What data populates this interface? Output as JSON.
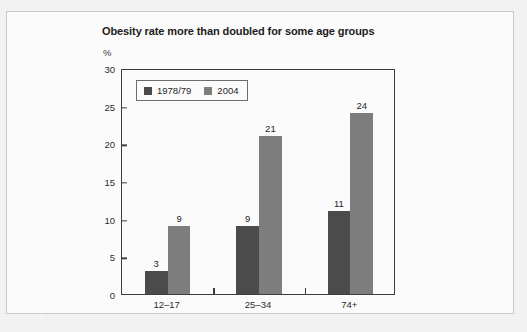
{
  "figure": {
    "title": "Obesity rate more than doubled for some age groups",
    "y_unit_label": "%"
  },
  "legend": {
    "entries": [
      {
        "label": "1978/79",
        "color": "#4b4b4b",
        "swatch_name": "legend-swatch-1978-79"
      },
      {
        "label": "2004",
        "color": "#7d7d7d",
        "swatch_name": "legend-swatch-2004"
      }
    ]
  },
  "chart_data": {
    "type": "bar",
    "title": "Obesity rate more than doubled for some age groups",
    "xlabel": "",
    "ylabel": "%",
    "ylim": [
      0,
      30
    ],
    "yticks": [
      0,
      5,
      10,
      15,
      20,
      25,
      30
    ],
    "ytick_labels": [
      "0",
      "5",
      "10",
      "15",
      "20",
      "25",
      "30"
    ],
    "grid": false,
    "legend_position": "top-left inside plot",
    "categories": [
      "12–17",
      "25–34",
      "74+"
    ],
    "series": [
      {
        "name": "1978/79",
        "color": "#4b4b4b",
        "values": [
          3,
          9,
          11
        ]
      },
      {
        "name": "2004",
        "color": "#7d7d7d",
        "values": [
          9,
          21,
          24
        ]
      }
    ],
    "data_labels": [
      [
        "3",
        "9"
      ],
      [
        "9",
        "21"
      ],
      [
        "11",
        "24"
      ]
    ]
  }
}
